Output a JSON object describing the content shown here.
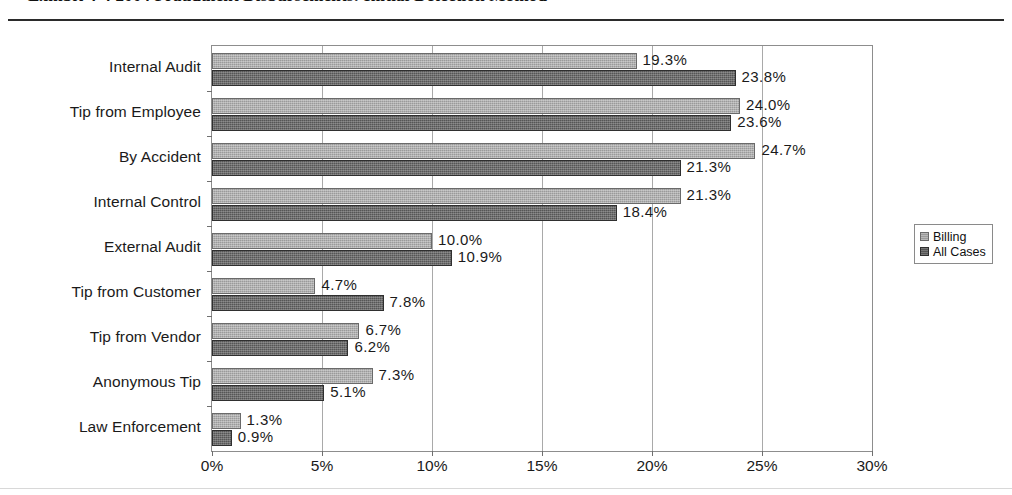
{
  "exhibit": {
    "title": "Exhibit 4-4    2004 Fraudulent Disbursements: Initial Detection Method"
  },
  "legend": {
    "position": "right",
    "items": [
      {
        "label": "Billing",
        "color": "#9a9a9a",
        "icon": "legend-swatch-billing"
      },
      {
        "label": "All Cases",
        "color": "#565656",
        "icon": "legend-swatch-all-cases"
      }
    ]
  },
  "axis": {
    "x_ticks": [
      "0%",
      "5%",
      "10%",
      "15%",
      "20%",
      "25%",
      "30%"
    ],
    "x_min": 0,
    "x_max": 30
  },
  "chart_data": {
    "type": "bar",
    "orientation": "horizontal",
    "title": "Exhibit 4-4    2004 Fraudulent Disbursements: Initial Detection Method",
    "xlabel": "",
    "ylabel": "",
    "xlim": [
      0,
      30
    ],
    "grid": true,
    "legend_position": "right",
    "tick_labels": [
      "0%",
      "5%",
      "10%",
      "15%",
      "20%",
      "25%",
      "30%"
    ],
    "value_suffix": "%",
    "categories": [
      "Internal Audit",
      "Tip from Employee",
      "By Accident",
      "Internal Control",
      "External Audit",
      "Tip from Customer",
      "Tip from Vendor",
      "Anonymous Tip",
      "Law Enforcement"
    ],
    "series": [
      {
        "name": "Billing",
        "color": "#9a9a9a",
        "values": [
          19.3,
          24.0,
          24.7,
          21.3,
          10.0,
          4.7,
          6.7,
          7.3,
          1.3
        ],
        "labels": [
          "19.3%",
          "24.0%",
          "24.7%",
          "21.3%",
          "10.0%",
          "4.7%",
          "6.7%",
          "7.3%",
          "1.3%"
        ]
      },
      {
        "name": "All Cases",
        "color": "#565656",
        "values": [
          23.8,
          23.6,
          21.3,
          18.4,
          10.9,
          7.8,
          6.2,
          5.1,
          0.9
        ],
        "labels": [
          "23.8%",
          "23.6%",
          "21.3%",
          "18.4%",
          "10.9%",
          "7.8%",
          "6.2%",
          "5.1%",
          "0.9%"
        ]
      }
    ]
  }
}
